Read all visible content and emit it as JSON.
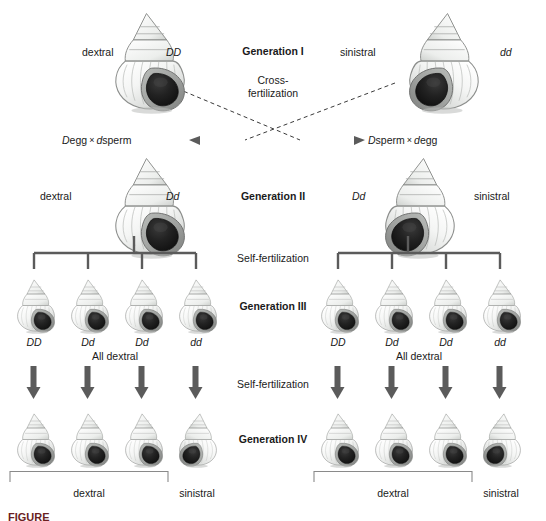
{
  "figure": {
    "caption_partial": "FIGURE"
  },
  "center_labels": {
    "gen1": "Generation I",
    "cross_line1": "Cross-",
    "cross_line2": "fertilization",
    "gen2": "Generation II",
    "self_fert_1": "Self-fertilization",
    "gen3": "Generation III",
    "self_fert_2": "Self-fertilization",
    "gen4": "Generation IV"
  },
  "generation_i": {
    "left": {
      "phenotype": "dextral",
      "genotype": "DD",
      "coil": "dextral"
    },
    "right": {
      "phenotype": "sinistral",
      "genotype": "dd",
      "coil": "sinistral"
    }
  },
  "gametes": {
    "left": {
      "a_allele": "D",
      "a_type": "egg",
      "operator": "×",
      "b_allele": "d",
      "b_type": "sperm"
    },
    "right": {
      "a_allele": "D",
      "a_type": "sperm",
      "operator": "×",
      "b_allele": "d",
      "b_type": "egg"
    }
  },
  "generation_ii": {
    "left": {
      "phenotype": "dextral",
      "genotype": "Dd",
      "coil": "dextral"
    },
    "right": {
      "phenotype": "sinistral",
      "genotype": "Dd",
      "coil": "sinistral"
    }
  },
  "generation_iii": {
    "left_group": {
      "genotypes": [
        "DD",
        "Dd",
        "Dd",
        "dd"
      ],
      "coils": [
        "dextral",
        "dextral",
        "dextral",
        "dextral"
      ],
      "summary": "All dextral"
    },
    "right_group": {
      "genotypes": [
        "DD",
        "Dd",
        "Dd",
        "dd"
      ],
      "coils": [
        "dextral",
        "dextral",
        "dextral",
        "dextral"
      ],
      "summary": "All dextral"
    }
  },
  "generation_iv": {
    "left_group": {
      "coils": [
        "dextral",
        "dextral",
        "dextral",
        "sinistral"
      ],
      "bracket_label": "dextral",
      "single_label": "sinistral"
    },
    "right_group": {
      "coils": [
        "dextral",
        "dextral",
        "dextral",
        "sinistral"
      ],
      "bracket_label": "dextral",
      "single_label": "sinistral"
    }
  },
  "colors": {
    "ink": "#1a1a1a",
    "pedigree_line": "#5b5b5b",
    "dashed_line": "#3a3a3a",
    "bracket": "#8a8a8a",
    "shell_light": "#f3f4f3",
    "shell_mid": "#cfd1cf",
    "shell_shadow": "#9a9c9a",
    "aperture": "#1c1c1c",
    "background": "#ffffff"
  }
}
